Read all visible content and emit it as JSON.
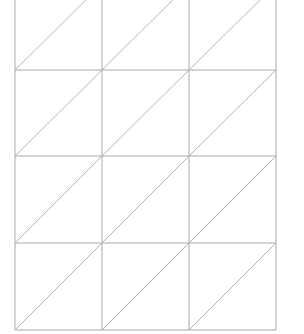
{
  "diagram": {
    "type": "triangulated-grid",
    "columns": 3,
    "rows": 4,
    "x_lines": [
      15,
      102,
      189,
      276
    ],
    "y_lines": [
      0,
      70,
      156,
      243,
      330
    ],
    "line_color": "#a8a8a8",
    "diagonal_color": "#b4b4b4",
    "diagonal_direction": "bottom-left-to-top-right"
  }
}
